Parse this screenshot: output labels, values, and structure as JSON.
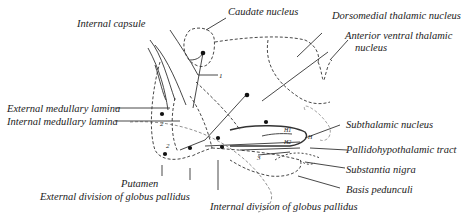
{
  "diagram": {
    "labels": {
      "internal_capsule": "Internal capsule",
      "caudate_nucleus": "Caudate nucleus",
      "dorsomedial_thalamic_nucleus": "Dorsomedial thalamic nucleus",
      "anterior_ventral_thalamic_nucleus_l1": "Anterior ventral thalamic",
      "anterior_ventral_thalamic_nucleus_l2": "nucleus",
      "external_medullary_lamina": "External medullary lamina",
      "internal_medullary_lamina": "Internal medullary lamina",
      "subthalamic_nucleus": "Subthalamic nucleus",
      "pallidohypothalamic_tract": "Pallidohypothalamic tract",
      "substantia_nigra": "Substantia nigra",
      "basis_pedunculi": "Basis pedunculi",
      "putamen": "Putamen",
      "external_division_globus_pallidus": "External division of globus pallidus",
      "internal_division_globus_pallidus": "Internal division of globus pallidus"
    },
    "markers": {
      "h1": "H1",
      "h2": "H2",
      "h": "H",
      "one": "1",
      "two": "2",
      "three": "3"
    },
    "colors": {
      "ink": "#222222",
      "background": "#ffffff"
    }
  }
}
